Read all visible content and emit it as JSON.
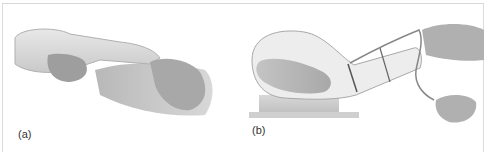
{
  "figure": {
    "panels": [
      {
        "label": "(a)",
        "description": "Hands holding a transparent bottle-shaped bag with forearm inserted, illustrated grayscale"
      },
      {
        "label": "(b)",
        "description": "Infant inside a transparent balloon-shaped bag on a stand, with a tube and hand pump"
      }
    ]
  }
}
